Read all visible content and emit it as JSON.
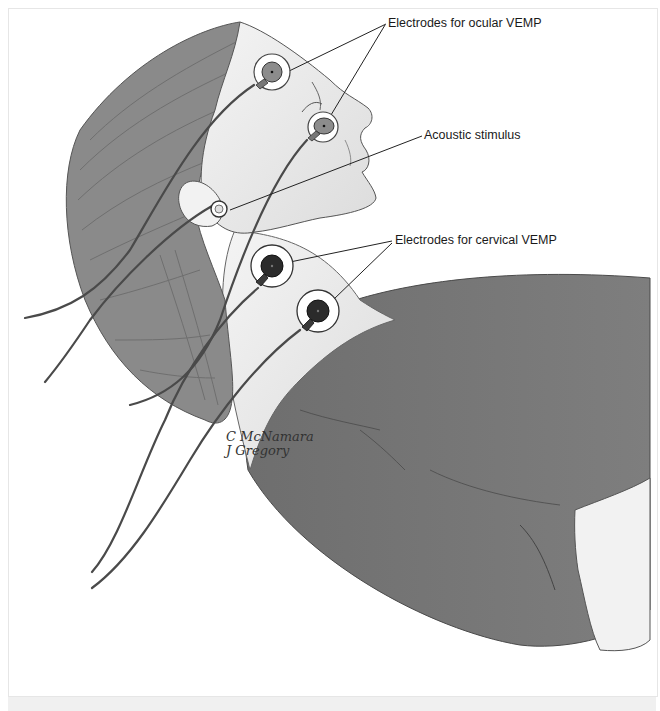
{
  "figure": {
    "labels": {
      "ocular": "Electrodes for ocular VEMP",
      "acoustic": "Acoustic stimulus",
      "cervical": "Electrodes for cervical VEMP"
    },
    "signature": {
      "line1": "C McNamara",
      "line2": "J Gregory"
    },
    "colors": {
      "shirt": "#7a7a7a",
      "hair": "#8a8a8a",
      "skin": "#e9e9e9",
      "electrode_ocular_center": "#8c8c8c",
      "electrode_cervical_center": "#2b2b2b",
      "leader_line": "#222222"
    }
  }
}
